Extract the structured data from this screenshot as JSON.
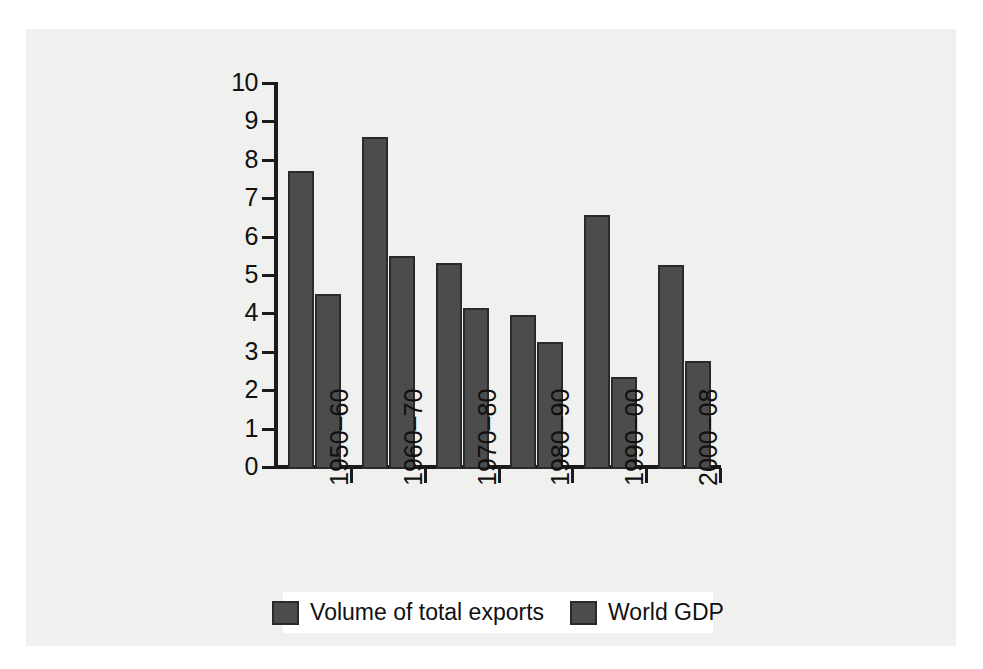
{
  "chart_data": {
    "type": "bar",
    "title": "",
    "subtitle": "",
    "xlabel": "",
    "ylabel": "",
    "ylim": [
      0,
      10
    ],
    "y_ticks": [
      "0",
      "1",
      "2",
      "3",
      "4",
      "5",
      "6",
      "7",
      "8",
      "9",
      "10"
    ],
    "grid": false,
    "legend_position": "bottom",
    "categories": [
      "1950–60",
      "1960–70",
      "1970–80",
      "1980–90",
      "1990–00",
      "2000–08"
    ],
    "series": [
      {
        "name": "Volume of total exports",
        "color": "#4c4c4c",
        "values": [
          7.7,
          8.6,
          5.3,
          3.95,
          6.55,
          5.25
        ]
      },
      {
        "name": "World GDP",
        "color": "#4c4c4c",
        "values": [
          4.5,
          5.5,
          4.15,
          3.25,
          2.35,
          2.75
        ]
      }
    ]
  },
  "legend": {
    "entries": [
      {
        "label": "Volume of total exports",
        "swatch_color": "#4c4c4c"
      },
      {
        "label": "World GDP",
        "swatch_color": "#4c4c4c"
      }
    ]
  },
  "colors": {
    "bar_fill": "#4c4c4c",
    "bar_stroke": "#2a2a2a",
    "axis": "#1b1b1b",
    "panel_background": "#f0f0ef",
    "page_background": "#ffffff",
    "text": "#101010"
  }
}
